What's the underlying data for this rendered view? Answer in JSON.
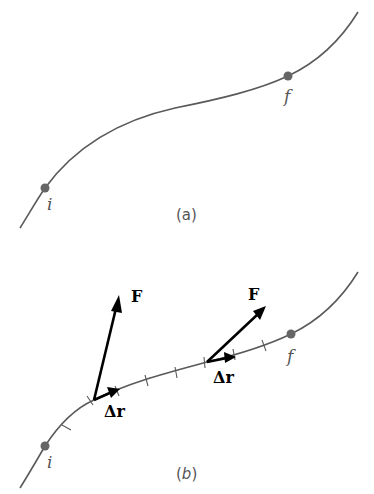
{
  "figure": {
    "panel_a": {
      "caption": "(a)",
      "caption_open": "(",
      "caption_letter": "a",
      "caption_close": ")",
      "points": [
        {
          "label": "i",
          "role": "initial-point"
        },
        {
          "label": "f",
          "role": "final-point"
        }
      ]
    },
    "panel_b": {
      "caption_open": "(",
      "caption_letter": "b",
      "caption_close": ")",
      "points": [
        {
          "label": "i",
          "role": "initial-point"
        },
        {
          "label": "f",
          "role": "final-point"
        }
      ],
      "vectors": [
        {
          "force_label": "F",
          "displacement_label": "Δr"
        },
        {
          "force_label": "F",
          "displacement_label": "Δr"
        }
      ],
      "tick_count": 9
    },
    "colors": {
      "curve": "#5a5a5a",
      "points": "#666666",
      "vectors": "#000000",
      "background": "#ffffff"
    }
  }
}
